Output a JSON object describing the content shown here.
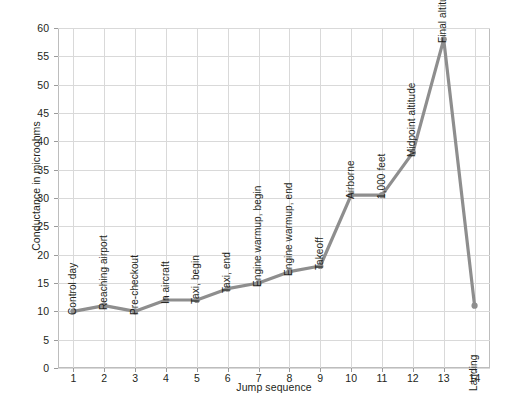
{
  "chart_data": {
    "type": "line",
    "title": "",
    "xlabel": "Jump sequence",
    "ylabel": "Conductance in microohms",
    "x": [
      1,
      2,
      3,
      4,
      5,
      6,
      7,
      8,
      9,
      10,
      11,
      12,
      13,
      14
    ],
    "values": [
      10,
      11,
      10,
      12,
      12,
      14,
      15,
      17,
      18,
      30.5,
      30.5,
      38,
      58,
      11
    ],
    "point_labels": [
      "Control day",
      "Reaching airport",
      "Pre-checkout",
      "In aircraft",
      "Taxi, begin",
      "Taxi, end",
      "Engine warmup, begin",
      "Engine warmup, end",
      "Takeoff",
      "Airborne",
      "1,000 feet",
      "Midpoint altitude",
      "Final altitude",
      "Landing"
    ],
    "xticklabels": [
      "1",
      "2",
      "3",
      "4",
      "5",
      "6",
      "7",
      "8",
      "9",
      "10",
      "11",
      "12",
      "13",
      "14"
    ],
    "yticklabels": [
      "0",
      "5",
      "10",
      "15",
      "20",
      "25",
      "30",
      "35",
      "40",
      "45",
      "50",
      "55",
      "60"
    ],
    "yticks": [
      0,
      5,
      10,
      15,
      20,
      25,
      30,
      35,
      40,
      45,
      50,
      55,
      60
    ],
    "ylim": [
      0,
      60
    ],
    "xlim": [
      0.5,
      14.5
    ],
    "grid": true,
    "legend": "none",
    "series_color": "#8e8e8e",
    "grid_color": "#d9d9d9",
    "axis_color": "#bdbdbd",
    "text_color": "#231f20",
    "marker": "circle"
  }
}
